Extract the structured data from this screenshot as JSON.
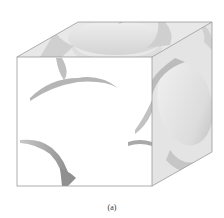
{
  "figure": {
    "caption": "(a)",
    "colors": {
      "background": "#ffffff",
      "edge": "#9a9a9a",
      "top_face": "#e6e6e6",
      "side_face": "#e2e2e2",
      "front_face": "#ffffff",
      "sphere_light": "#f4f4f4",
      "sphere_shadow": "#a8a8a8"
    },
    "cube": {
      "front_top_left": [
        17,
        57
      ],
      "front_top_right": [
        152,
        57
      ],
      "front_bottom_right": [
        152,
        186
      ],
      "front_bottom_left": [
        17,
        186
      ],
      "back_top_left": [
        78,
        22
      ],
      "back_top_right": [
        212,
        22
      ],
      "back_bottom_right": [
        212,
        152
      ]
    }
  }
}
